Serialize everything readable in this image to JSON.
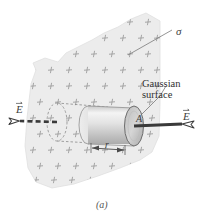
{
  "figure": {
    "caption": "(a)",
    "labels": {
      "sigma": "σ",
      "gaussian_line1": "Gaussian",
      "gaussian_line2": "surface",
      "field_right": "E",
      "field_left": "E",
      "area": "A",
      "radius": "r"
    },
    "colors": {
      "sheet_fill": "#ececec",
      "sheet_edge": "#d8d8d8",
      "charge_mark": "#9a9a9a",
      "cylinder_light": "#f2f2f2",
      "cylinder_mid": "#d9d9d9",
      "cylinder_dark": "#b8b8b8",
      "outline": "#4a4a4a",
      "leader": "#6b6b6b",
      "text": "#3d3d3d"
    },
    "description": {
      "object": "charged infinite sheet with surface charge density sigma",
      "gauss_shape": "cylinder",
      "field_direction_left": "outward-left",
      "field_direction_right": "outward-right"
    }
  }
}
